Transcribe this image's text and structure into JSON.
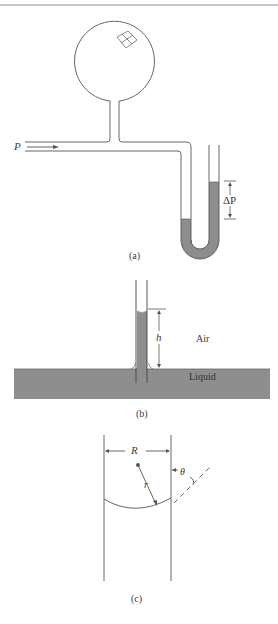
{
  "figure": {
    "rule_color": "#b5b5b5",
    "line_color": "#555555",
    "liquid_color": "#8e8e8e",
    "panels": [
      {
        "id": "a",
        "caption": "(a)",
        "labels": {
          "pressure": "P",
          "delta_pressure": "ΔP"
        }
      },
      {
        "id": "b",
        "caption": "(b)",
        "labels": {
          "height": "h",
          "air": "Air",
          "liquid": "Liquid"
        }
      },
      {
        "id": "c",
        "caption": "(c)",
        "labels": {
          "tube_radius": "R",
          "curvature_radius": "r",
          "contact_angle": "θ"
        }
      }
    ]
  }
}
